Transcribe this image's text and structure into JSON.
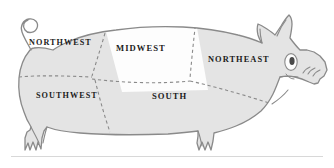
{
  "figure": {
    "name": "pig-region-map",
    "orientation": "facing-right",
    "colors": {
      "body_fill": "#e4e4e4",
      "highlight_fill": "#fdfdfd",
      "outline": "#8a8a8a",
      "divider": "#8a8a8a",
      "label_text": "#1b1b1b",
      "rule": "#d8d8d8",
      "background": "#ffffff",
      "eye_pupil": "#4a4a4a"
    },
    "divider_style": "dashed"
  },
  "regions": [
    {
      "id": "northwest",
      "label": "NORTHWEST",
      "fill": "#e4e4e4"
    },
    {
      "id": "midwest",
      "label": "MIDWEST",
      "fill": "#fdfdfd"
    },
    {
      "id": "northeast",
      "label": "NORTHEAST",
      "fill": "#e4e4e4"
    },
    {
      "id": "southwest",
      "label": "SOUTHWEST",
      "fill": "#e4e4e4"
    },
    {
      "id": "south",
      "label": "SOUTH",
      "fill": "#e4e4e4"
    }
  ],
  "anatomy": [
    {
      "id": "tail",
      "label": "curly tail"
    },
    {
      "id": "ear",
      "label": "ear"
    },
    {
      "id": "eye",
      "label": "eye"
    },
    {
      "id": "snout",
      "label": "snout"
    },
    {
      "id": "foreleg",
      "label": "front leg"
    },
    {
      "id": "hindleg",
      "label": "hind leg"
    }
  ]
}
